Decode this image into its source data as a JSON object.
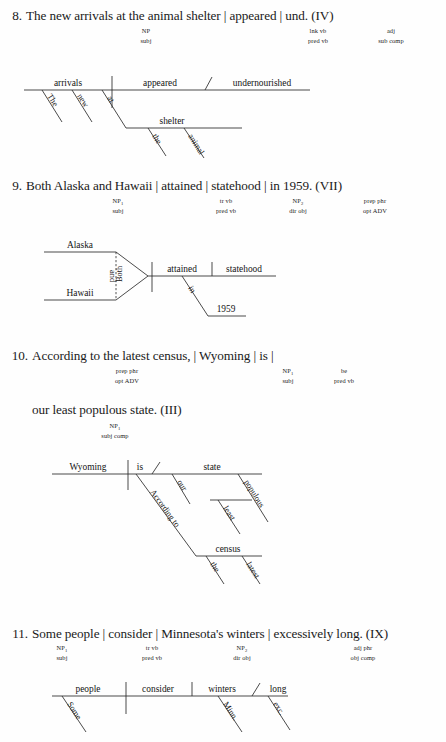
{
  "page": {
    "background": "#fefefe",
    "ink": "#1a1a1a"
  },
  "exercises": [
    {
      "number": "8.",
      "sentence": "The new arrivals at the animal shelter | appeared | und. (IV)",
      "annotations": [
        {
          "line1": "NP",
          "sub": "",
          "line2": "subj"
        },
        {
          "line1": "lnk vb",
          "sub": "",
          "line2": "pred vb"
        },
        {
          "line1": "adj",
          "sub": "",
          "line2": "sub comp"
        }
      ],
      "diagram": {
        "subject": "arrivals",
        "verb": "appeared",
        "complement": "undernourished",
        "modifiers": [
          "The",
          "new"
        ],
        "preposition": "at",
        "prep_object": "shelter",
        "prep_object_modifiers": [
          "the",
          "animal"
        ]
      }
    },
    {
      "number": "9.",
      "sentence": "Both Alaska and Hawaii | attained | statehood | in 1959. (VII)",
      "annotations": [
        {
          "line1": "NP",
          "sub": "1",
          "line2": "subj"
        },
        {
          "line1": "tr vb",
          "sub": "",
          "line2": "pred vb"
        },
        {
          "line1": "NP",
          "sub": "2",
          "line2": "dir obj"
        },
        {
          "line1": "prep phr",
          "sub": "",
          "line2": "opt ADV"
        }
      ],
      "diagram": {
        "subject_a": "Alaska",
        "subject_b": "Hawaii",
        "correlative_a": "Both",
        "correlative_b": "and",
        "verb": "attained",
        "object": "statehood",
        "preposition": "in",
        "prep_object": "1959"
      }
    },
    {
      "number": "10.",
      "sentence": "According to the latest census, | Wyoming | is |",
      "sentence2": "our least populous state. (III)",
      "annotations": [
        {
          "line1": "prep phr",
          "sub": "",
          "line2": "opt ADV"
        },
        {
          "line1": "NP",
          "sub": "1",
          "line2": "subj"
        },
        {
          "line1": "be",
          "sub": "",
          "line2": "pred vb"
        }
      ],
      "annotations2": [
        {
          "line1": "NP",
          "sub": "1",
          "line2": "subj comp"
        }
      ],
      "diagram": {
        "subject": "Wyoming",
        "verb": "is",
        "complement": "state",
        "complement_modifiers": [
          "our",
          "populous"
        ],
        "nested_modifier": "least",
        "preposition": "According to",
        "prep_object": "census",
        "prep_object_modifiers": [
          "the",
          "latest"
        ]
      }
    },
    {
      "number": "11.",
      "sentence": "Some people | consider | Minnesota's winters | excessively long. (IX)",
      "annotations": [
        {
          "line1": "NP",
          "sub": "1",
          "line2": "subj"
        },
        {
          "line1": "tr vb",
          "sub": "",
          "line2": "pred vb"
        },
        {
          "line1": "NP",
          "sub": "2",
          "line2": "dir obj"
        },
        {
          "line1": "adj phr",
          "sub": "",
          "line2": "obj comp"
        }
      ],
      "diagram": {
        "subject": "people",
        "verb": "consider",
        "object": "winters",
        "object_complement": "long",
        "subject_modifier": "Some",
        "object_modifier": "Minn.",
        "complement_modifier": "exc."
      }
    }
  ]
}
